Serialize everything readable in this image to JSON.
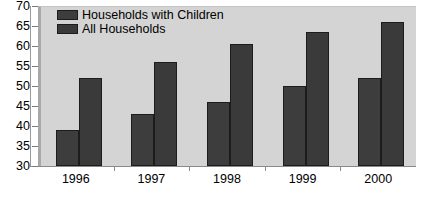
{
  "chart_data": {
    "type": "bar",
    "title": "",
    "subtitle": "",
    "xlabel": "",
    "ylabel": "",
    "categories": [
      "1996",
      "1997",
      "1998",
      "1999",
      "2000"
    ],
    "series": [
      {
        "name": "Households with Children",
        "color": "#3d3d3d",
        "values": [
          39,
          43,
          46,
          50,
          52
        ]
      },
      {
        "name": "All Households",
        "color": "#3a3a3a",
        "values": [
          52,
          56,
          60.5,
          63.5,
          66
        ]
      }
    ],
    "ylim": [
      30,
      70
    ],
    "yticks": [
      30,
      35,
      40,
      45,
      50,
      55,
      60,
      65,
      70
    ],
    "ytick_labels": [
      "30",
      "35",
      "40",
      "45",
      "50",
      "55",
      "60",
      "65",
      "70"
    ],
    "grid": false,
    "legend_position": "top-left",
    "annotations": []
  },
  "legend": {
    "entries": [
      {
        "label": "Households with Children",
        "swatch": "legend-swatch-households-with-children"
      },
      {
        "label": "All Households",
        "swatch": "legend-swatch-all-households"
      }
    ]
  },
  "colors": {
    "plot_background": "#d4d4d4",
    "page_background": "#ffffff",
    "bar_fill": "#3a3a3a",
    "bar_outline": "#1c1c1c",
    "axis": "#8a8a8a",
    "text": "#000000"
  },
  "footer": {
    "cut_off_text": ""
  }
}
